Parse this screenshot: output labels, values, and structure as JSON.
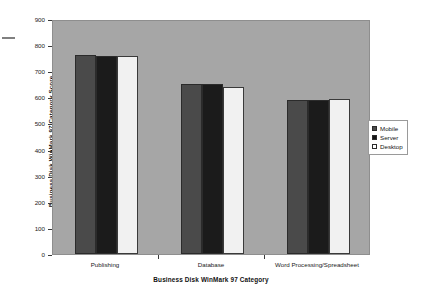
{
  "chart_data": {
    "type": "bar",
    "title": "",
    "xlabel": "Business Disk WinMark 97 Category",
    "ylabel": "Business Disk WinMark 97 Category Score",
    "categories": [
      "Publishing",
      "Database",
      "Word Processing/Spreadsheet"
    ],
    "series": [
      {
        "name": "Mobile",
        "color": "#4a4a4a",
        "values": [
          762,
          650,
          590
        ]
      },
      {
        "name": "Server",
        "color": "#1b1b1b",
        "values": [
          760,
          650,
          588
        ]
      },
      {
        "name": "Desktop",
        "color": "#f1f1f1",
        "values": [
          758,
          638,
          592
        ]
      }
    ],
    "ylim": [
      0,
      900
    ],
    "yticks": [
      0,
      100,
      200,
      300,
      400,
      500,
      600,
      700,
      800,
      900
    ],
    "ytick_labels": [
      "0",
      "100",
      "200",
      "300",
      "400",
      "500",
      "600",
      "700",
      "800",
      "900"
    ],
    "grid": false,
    "legend_position": "right",
    "plot_background": "#a6a6a6"
  },
  "legend": {
    "entries": [
      {
        "label": "Mobile"
      },
      {
        "label": "Server"
      },
      {
        "label": "Desktop"
      }
    ]
  }
}
